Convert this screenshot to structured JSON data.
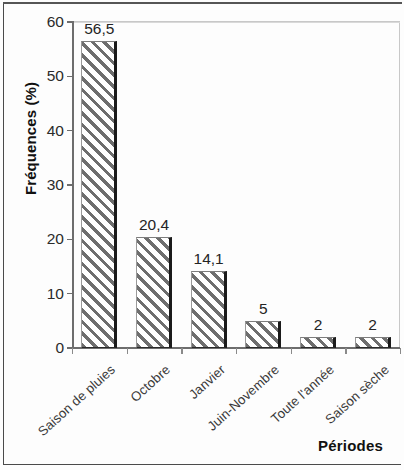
{
  "chart_data": {
    "type": "bar",
    "title": "",
    "subtitle": "",
    "xlabel": "Périodes",
    "ylabel": "Fréquences (%)",
    "categories": [
      "Saison de pluies",
      "Octobre",
      "Janvier",
      "Juin-Novembre",
      "Toute l'année",
      "Saison sèche"
    ],
    "values": [
      56.5,
      20.4,
      14.1,
      5,
      2,
      2
    ],
    "value_labels": [
      "56,5",
      "20,4",
      "14,1",
      "5",
      "2",
      "2"
    ],
    "ylim": [
      0,
      60
    ],
    "ytick_labels": [
      "0",
      "10",
      "20",
      "30",
      "40",
      "50",
      "60"
    ],
    "ytick_values": [
      0,
      10,
      20,
      30,
      40,
      50,
      60
    ],
    "grid": "horizontal gridline at 60 only",
    "legend": "none",
    "bar_fill": "diagonal-hatch",
    "colors": {
      "bar_hatch": "#6e6e6e",
      "bar_background": "#ffffff",
      "bar_edge": "#1b1b1b",
      "axis": "#6d6d6d",
      "gridline": "#d9d9d9",
      "text": "#242424",
      "frame": "#4a4a4a"
    }
  }
}
